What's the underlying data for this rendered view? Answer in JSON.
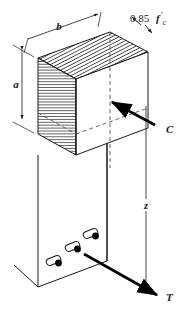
{
  "figure": {
    "name": "concrete-beam-stress-block",
    "background": "#ffffff",
    "line_color": "#1a1a1a",
    "hatch_color": "#2b2b2b",
    "arrow_color": "#000000",
    "dash_color": "#555555"
  },
  "labels": {
    "width_b": "b",
    "depth_a": "a",
    "stress_value": "0.85",
    "stress_symbol": "f",
    "stress_prime": "′",
    "stress_subscript": "c",
    "compression_force": "C",
    "lever_arm": "z",
    "tension_force": "T"
  },
  "rebar": {
    "count": 3,
    "fill": "#000000",
    "outline": "#1a1a1a"
  }
}
